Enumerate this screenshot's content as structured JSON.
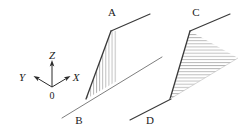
{
  "figure": {
    "background_color": "#ffffff",
    "line_color": "#3a3a3a",
    "hatch_color": "#9a9a9a",
    "light_line_color": "#8a8a8a",
    "text_color": "#1a1a1a",
    "width": 249,
    "height": 139
  },
  "axes": {
    "name": "coordinate-triad",
    "origin": {
      "label": "0",
      "x": 52,
      "y": 88
    },
    "arms": [
      {
        "name": "z-axis",
        "label": "Z",
        "tip_x": 52,
        "tip_y": 62,
        "label_x": 52,
        "label_y": 58
      },
      {
        "name": "x-axis",
        "label": "X",
        "tip_x": 70,
        "tip_y": 77,
        "label_x": 75,
        "label_y": 79
      },
      {
        "name": "y-axis",
        "label": "Y",
        "tip_x": 34,
        "tip_y": 77,
        "label_x": 22,
        "label_y": 79
      }
    ]
  },
  "shapes": [
    {
      "name": "left-figure",
      "hatch_direction": "vertical",
      "labels": [
        {
          "id": "A",
          "text": "A",
          "x": 112,
          "y": 16
        },
        {
          "id": "B",
          "text": "B",
          "x": 79,
          "y": 122
        }
      ],
      "base_line": {
        "x1": 62,
        "y1": 118,
        "x2": 162,
        "y2": 57
      },
      "top_line": {
        "x1": 111,
        "y1": 31,
        "x2": 148,
        "y2": 15
      },
      "edge_line": {
        "x1": 86,
        "y1": 99,
        "x2": 111,
        "y2": 31
      },
      "hatch_right_x": 117
    },
    {
      "name": "right-figure",
      "hatch_direction": "horizontal",
      "labels": [
        {
          "id": "C",
          "text": "C",
          "x": 196,
          "y": 16
        },
        {
          "id": "D",
          "text": "D",
          "x": 150,
          "y": 122
        }
      ],
      "base_line": {
        "x1": 130,
        "y1": 119,
        "x2": 170,
        "y2": 99
      },
      "top_line": {
        "x1": 190,
        "y1": 31,
        "x2": 228,
        "y2": 15
      },
      "edge_line": {
        "x1": 170,
        "y1": 99,
        "x2": 190,
        "y2": 31
      },
      "right_tip": {
        "x": 238,
        "y": 58
      }
    }
  ]
}
